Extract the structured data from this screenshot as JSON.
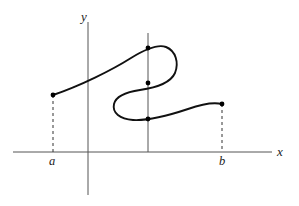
{
  "figure": {
    "background_color": "#ffffff",
    "width": 299,
    "height": 206
  },
  "axes": {
    "x_axis": {
      "label": "x",
      "label_x": 280,
      "label_y": 156,
      "y_position": 152,
      "x_start": 13,
      "x_end": 272,
      "color": "#555555"
    },
    "y_axis": {
      "label": "y",
      "label_x": 84,
      "label_y": 21,
      "x_position": 88,
      "y_start": 22,
      "y_end": 195,
      "color": "#555555"
    }
  },
  "tick_labels": [
    {
      "name": "a",
      "text": "a",
      "x": 52,
      "y": 165,
      "axis_x": 53
    },
    {
      "name": "b",
      "text": "b",
      "x": 222,
      "y": 165,
      "axis_x": 222
    }
  ],
  "vertical_test_line": {
    "name": "vertical-test-line",
    "x": 148,
    "y_top": 33,
    "y_bottom": 152,
    "color": "#555555"
  },
  "curve": {
    "name": "function-curve",
    "color": "#111111",
    "stroke_width": 1.9,
    "path": "M 53,95 C 80,86 112,70 131,58 C 144,50 158,44 166,47 C 176,51 179,63 175,73 C 170,84 154,88 140,90 C 126,92 116,96 114,104 C 112,113 120,119 133,120 C 150,121 170,115 188,109 C 202,104 214,102 222,104",
    "start_point": {
      "x": 53,
      "y": 95
    },
    "end_point": {
      "x": 222,
      "y": 104
    }
  },
  "dashed_drop_lines": [
    {
      "name": "drop-line-a",
      "x": 53,
      "y_top": 95,
      "y_bottom": 152
    },
    {
      "name": "drop-line-b",
      "x": 222,
      "y_top": 104,
      "y_bottom": 152
    }
  ],
  "points": [
    {
      "name": "curve-start-point",
      "x": 53,
      "y": 95,
      "r": 2.4
    },
    {
      "name": "intersection-point-top",
      "x": 148,
      "y": 48,
      "r": 2.4
    },
    {
      "name": "intersection-point-middle",
      "x": 148,
      "y": 83,
      "r": 2.4
    },
    {
      "name": "intersection-point-bottom",
      "x": 148,
      "y": 119,
      "r": 2.4
    },
    {
      "name": "curve-end-point",
      "x": 222,
      "y": 104,
      "r": 2.4
    }
  ],
  "chart_data": {
    "type": "line",
    "title": "",
    "xlabel": "x",
    "ylabel": "y",
    "grid": false,
    "legend": "none",
    "xlim": [
      13,
      272
    ],
    "ylim": [
      195,
      22
    ],
    "annotations": [
      {
        "text": "a",
        "x": 53,
        "y": 165
      },
      {
        "text": "b",
        "x": 222,
        "y": 165
      },
      {
        "text": "x",
        "x": 280,
        "y": 156
      },
      {
        "text": "y",
        "x": 84,
        "y": 21
      }
    ],
    "series": [
      {
        "name": "curve",
        "x": [
          53,
          80,
          105,
          131,
          148,
          160,
          168,
          175,
          174,
          164,
          148,
          132,
          119,
          114,
          117,
          128,
          148,
          170,
          192,
          210,
          222
        ],
        "y": [
          95,
          86,
          74,
          58,
          48,
          45,
          47,
          58,
          72,
          84,
          88,
          91,
          99,
          108,
          115,
          120,
          119,
          114,
          108,
          105,
          104
        ]
      },
      {
        "name": "vertical-test-line",
        "x": [
          148,
          148
        ],
        "y": [
          33,
          152
        ]
      },
      {
        "name": "drop-line-a",
        "x": [
          53,
          53
        ],
        "y": [
          95,
          152
        ]
      },
      {
        "name": "drop-line-b",
        "x": [
          222,
          222
        ],
        "y": [
          104,
          152
        ]
      }
    ],
    "marked_points": [
      {
        "label": "left endpoint",
        "x": 53,
        "y": 95
      },
      {
        "label": "upper intersection",
        "x": 148,
        "y": 48
      },
      {
        "label": "middle intersection",
        "x": 148,
        "y": 83
      },
      {
        "label": "lower intersection",
        "x": 148,
        "y": 119
      },
      {
        "label": "right endpoint",
        "x": 222,
        "y": 104
      }
    ]
  }
}
